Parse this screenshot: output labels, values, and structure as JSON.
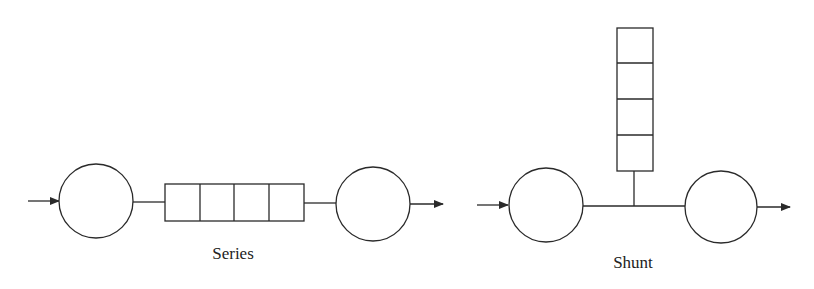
{
  "diagrams": [
    {
      "id": "series",
      "label": "Series",
      "queue_slots": 4,
      "queue_orientation": "horizontal",
      "description": "Server -> queue -> server in series"
    },
    {
      "id": "shunt",
      "label": "Shunt",
      "queue_slots": 4,
      "queue_orientation": "vertical",
      "description": "Server -> server with queue attached as a shunt branch"
    }
  ],
  "colors": {
    "line": "#2a2a2a",
    "background": "#ffffff"
  }
}
